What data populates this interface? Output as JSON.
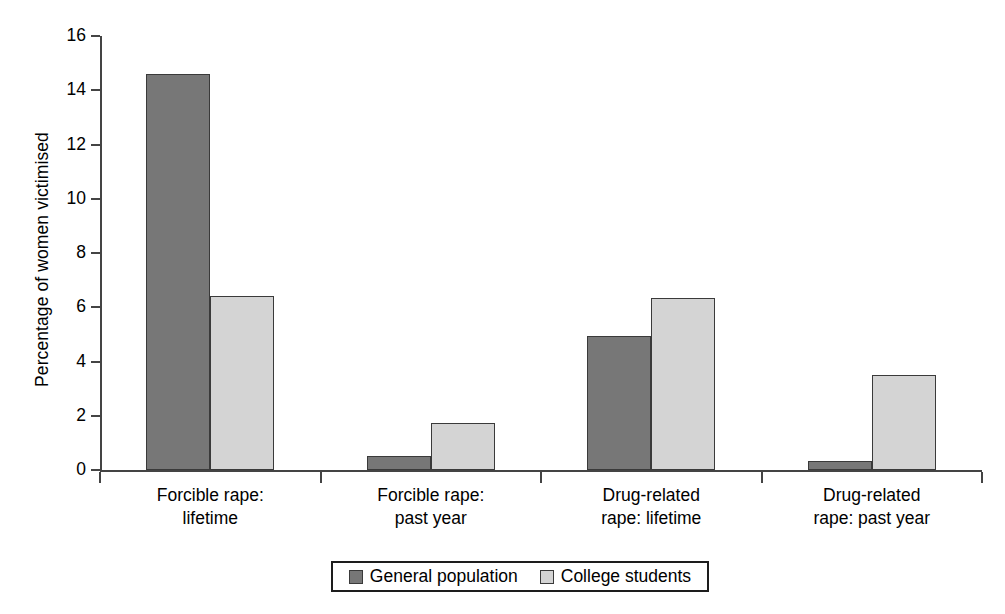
{
  "chart_data": {
    "type": "bar",
    "title": "",
    "xlabel": "",
    "ylabel": "Percentage of women victimised",
    "categories": [
      "Forcible rape:\nlifetime",
      "Forcible rape:\npast year",
      "Drug-related\nrape: lifetime",
      "Drug-related\nrape: past year"
    ],
    "series": [
      {
        "name": "General population",
        "color": "#777777",
        "values": [
          14.6,
          0.5,
          4.95,
          0.35
        ]
      },
      {
        "name": "College students",
        "color": "#d4d4d4",
        "values": [
          6.4,
          1.75,
          6.35,
          3.5
        ]
      }
    ],
    "ylim": [
      0,
      16
    ],
    "yticks": [
      0,
      2,
      4,
      6,
      8,
      10,
      12,
      14,
      16
    ],
    "ytick_labels": [
      "0",
      "2",
      "4",
      "6",
      "8",
      "10",
      "12",
      "14",
      "16"
    ],
    "grid": false,
    "legend_position": "bottom-center"
  },
  "legend": {
    "entries": [
      {
        "label": "General population",
        "swatch": "dark-gray-swatch"
      },
      {
        "label": "College students",
        "swatch": "light-gray-swatch"
      }
    ]
  }
}
